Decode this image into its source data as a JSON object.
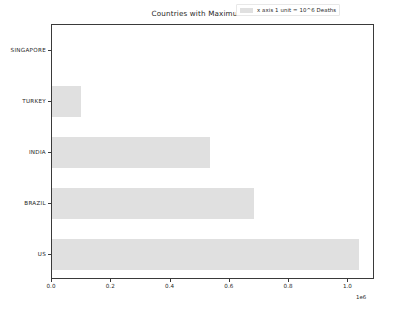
{
  "chart_data": {
    "type": "bar",
    "orientation": "horizontal",
    "title": "Countries with Maximum Deaths",
    "xlabel": "",
    "ylabel": "",
    "categories": [
      "SINGAPORE",
      "TURKEY",
      "INDIA",
      "BRAZIL",
      "US"
    ],
    "values": [
      0,
      99000,
      534000,
      680000,
      1035000
    ],
    "xlim": [
      0,
      1090000
    ],
    "xticks": [
      0,
      200000,
      400000,
      600000,
      800000,
      1000000
    ],
    "xtick_labels": [
      "0.0",
      "0.2",
      "0.4",
      "0.6",
      "0.8",
      "1.0"
    ],
    "x_offset_label": "1e6",
    "grid": false,
    "legend": {
      "position": "upper right",
      "entries": [
        {
          "label": "x axis 1 unit = 10^6 Deaths",
          "color": "#e0e0e0"
        }
      ]
    },
    "bar_color": "#e0e0e0",
    "axis_color": "#3a3a3a",
    "background": "#ffffff"
  }
}
